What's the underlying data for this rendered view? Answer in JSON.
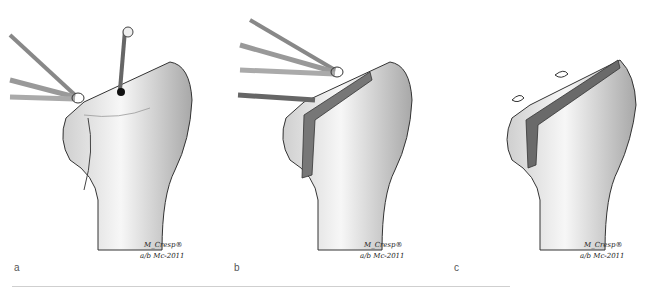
{
  "figure": {
    "panels": [
      {
        "label": "a",
        "signature_name": "M_Cresp®",
        "signature_date": "a/b  Mc-2011",
        "description": "bone with retractors and drill guide"
      },
      {
        "label": "b",
        "signature_name": "M_Cresp®",
        "signature_date": "a/b  Mc-2011",
        "description": "bone with retractors, saw blade and osteotomy"
      },
      {
        "label": "c",
        "signature_name": "M_Cresp®",
        "signature_date": "a/b  Mc-2011",
        "description": "bone after osteotomy with sutures"
      }
    ]
  }
}
